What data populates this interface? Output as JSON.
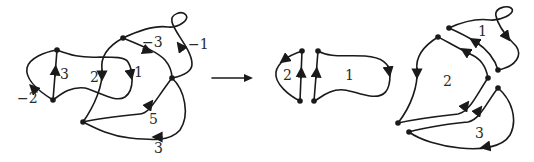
{
  "figure": {
    "transform_arrow": "→",
    "colors": {
      "stroke": "#1a1a1a",
      "background": "#ffffff"
    }
  },
  "left_graph": {
    "edge_labels": [
      {
        "id": "e3",
        "text": "3"
      },
      {
        "id": "em2",
        "text": "−2"
      },
      {
        "id": "e2",
        "text": "2"
      },
      {
        "id": "e1",
        "text": "1"
      },
      {
        "id": "em3",
        "text": "−3"
      },
      {
        "id": "em1",
        "text": "−1"
      },
      {
        "id": "e5",
        "text": "5"
      },
      {
        "id": "e3b",
        "text": "3"
      }
    ]
  },
  "middle_graph": {
    "cycle_labels": [
      {
        "id": "c2",
        "text": "2"
      },
      {
        "id": "c1",
        "text": "1"
      }
    ]
  },
  "right_graph": {
    "cycle_labels": [
      {
        "id": "c1",
        "text": "1"
      },
      {
        "id": "c2",
        "text": "2"
      },
      {
        "id": "c3",
        "text": "3"
      }
    ]
  }
}
